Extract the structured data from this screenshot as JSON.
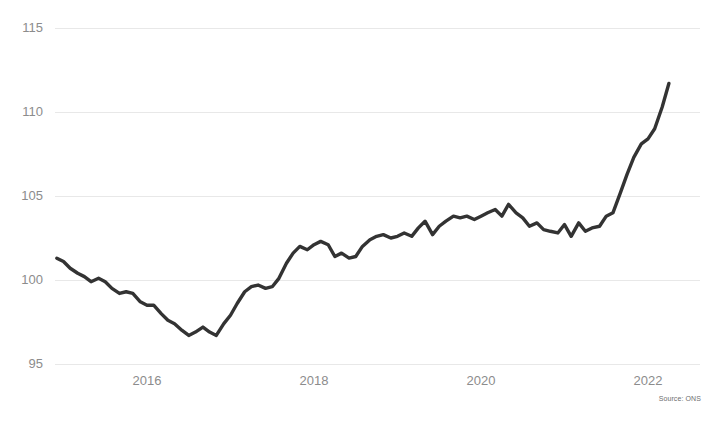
{
  "source_note": "Source: ONS",
  "chart_data": {
    "type": "line",
    "title": "",
    "subtitle": "",
    "xlabel": "",
    "ylabel": "",
    "grid": "horizontal",
    "legend": "none",
    "xlim": [
      2014.9,
      2022.35
    ],
    "ylim": [
      93.8,
      115.9
    ],
    "yticks": [
      95,
      100,
      105,
      110,
      115
    ],
    "ytick_labels": [
      "95",
      "100",
      "105",
      "110",
      "115"
    ],
    "xticks": [
      2016,
      2018,
      2020,
      2022
    ],
    "xtick_labels": [
      "2016",
      "2018",
      "2020",
      "2022"
    ],
    "series": [
      {
        "name": "Index",
        "color": "#333333",
        "x": [
          2014.92,
          2015.0,
          2015.08,
          2015.17,
          2015.25,
          2015.33,
          2015.42,
          2015.5,
          2015.58,
          2015.67,
          2015.75,
          2015.83,
          2015.92,
          2016.0,
          2016.08,
          2016.17,
          2016.25,
          2016.33,
          2016.42,
          2016.5,
          2016.58,
          2016.67,
          2016.75,
          2016.83,
          2016.92,
          2017.0,
          2017.08,
          2017.17,
          2017.25,
          2017.33,
          2017.42,
          2017.5,
          2017.58,
          2017.67,
          2017.75,
          2017.83,
          2017.92,
          2018.0,
          2018.08,
          2018.17,
          2018.25,
          2018.33,
          2018.42,
          2018.5,
          2018.58,
          2018.67,
          2018.75,
          2018.83,
          2018.92,
          2019.0,
          2019.08,
          2019.17,
          2019.25,
          2019.33,
          2019.42,
          2019.5,
          2019.58,
          2019.67,
          2019.75,
          2019.83,
          2019.92,
          2020.0,
          2020.08,
          2020.17,
          2020.25,
          2020.33,
          2020.42,
          2020.5,
          2020.58,
          2020.67,
          2020.75,
          2020.83,
          2020.92,
          2021.0,
          2021.08,
          2021.17,
          2021.25,
          2021.33,
          2021.42,
          2021.5,
          2021.58,
          2021.67,
          2021.75,
          2021.83,
          2021.92,
          2022.0,
          2022.08,
          2022.17,
          2022.25
        ],
        "y": [
          101.3,
          101.1,
          100.7,
          100.4,
          100.2,
          99.9,
          100.1,
          99.9,
          99.5,
          99.2,
          99.3,
          99.2,
          98.7,
          98.5,
          98.5,
          98.0,
          97.6,
          97.4,
          97.0,
          96.7,
          96.9,
          97.2,
          96.9,
          96.7,
          97.4,
          97.9,
          98.6,
          99.3,
          99.6,
          99.7,
          99.5,
          99.6,
          100.1,
          101.0,
          101.6,
          102.0,
          101.8,
          102.1,
          102.3,
          102.1,
          101.4,
          101.6,
          101.3,
          101.4,
          102.0,
          102.4,
          102.6,
          102.7,
          102.5,
          102.6,
          102.8,
          102.6,
          103.1,
          103.5,
          102.7,
          103.2,
          103.5,
          103.8,
          103.7,
          103.8,
          103.6,
          103.8,
          104.0,
          104.2,
          103.8,
          104.5,
          104.0,
          103.7,
          103.2,
          103.4,
          103.0,
          102.9,
          102.8,
          103.3,
          102.6,
          103.4,
          102.9,
          103.1,
          103.2,
          103.8,
          104.0,
          105.2,
          106.3,
          107.3,
          108.1,
          108.4,
          109.0,
          110.3,
          111.7
        ]
      }
    ]
  }
}
